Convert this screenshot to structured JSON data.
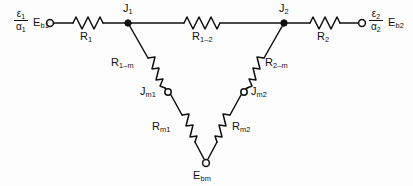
{
  "figure": {
    "type": "radiation-resistance-network-diagram",
    "background_color": "#fdfdfd",
    "line_color": "#101010"
  },
  "terminals": {
    "left": {
      "potential_label": "E",
      "potential_sub": "b1",
      "emissivity_numerator": "ε",
      "emissivity_numerator_sub": "1",
      "emissivity_denominator": "α",
      "emissivity_denominator_sub": "1",
      "node_type": "open-circle"
    },
    "right": {
      "potential_label": "E",
      "potential_sub": "b2",
      "emissivity_numerator": "ε",
      "emissivity_numerator_sub": "2",
      "emissivity_denominator": "α",
      "emissivity_denominator_sub": "2",
      "node_type": "open-circle"
    },
    "bottom": {
      "potential_label": "E",
      "potential_sub": "bm",
      "node_type": "open-circle"
    }
  },
  "nodes": [
    {
      "id": "J1",
      "label": "J",
      "sub": "1",
      "type": "filled-dot",
      "x": 128,
      "y": 23
    },
    {
      "id": "J2",
      "label": "J",
      "sub": "2",
      "type": "filled-dot",
      "x": 284,
      "y": 23
    },
    {
      "id": "Jm1",
      "label": "J",
      "sub": "m1",
      "type": "open-circle",
      "x": 168,
      "y": 92
    },
    {
      "id": "Jm2",
      "label": "J",
      "sub": "m2",
      "type": "open-circle",
      "x": 244,
      "y": 92
    },
    {
      "id": "Ebm",
      "label": "E",
      "sub": "bm",
      "type": "open-circle",
      "x": 206,
      "y": 163
    },
    {
      "id": "Eb1",
      "label": "E",
      "sub": "b1",
      "type": "open-circle",
      "x": 50,
      "y": 23
    },
    {
      "id": "Eb2",
      "label": "E",
      "sub": "b2",
      "type": "open-circle",
      "x": 362,
      "y": 23
    }
  ],
  "resistors": [
    {
      "id": "R1",
      "label": "R",
      "sub": "1",
      "between": [
        "Eb1",
        "J1"
      ]
    },
    {
      "id": "R1-2",
      "label": "R",
      "sub": "1–2",
      "between": [
        "J1",
        "J2"
      ]
    },
    {
      "id": "R2",
      "label": "R",
      "sub": "2",
      "between": [
        "J2",
        "Eb2"
      ]
    },
    {
      "id": "R1-m",
      "label": "R",
      "sub": "1–m",
      "between": [
        "J1",
        "Jm1"
      ]
    },
    {
      "id": "R2-m",
      "label": "R",
      "sub": "2–m",
      "between": [
        "J2",
        "Jm2"
      ]
    },
    {
      "id": "Rm1",
      "label": "R",
      "sub": "m1",
      "between": [
        "Jm1",
        "Ebm"
      ]
    },
    {
      "id": "Rm2",
      "label": "R",
      "sub": "m2",
      "between": [
        "Jm2",
        "Ebm"
      ]
    }
  ]
}
